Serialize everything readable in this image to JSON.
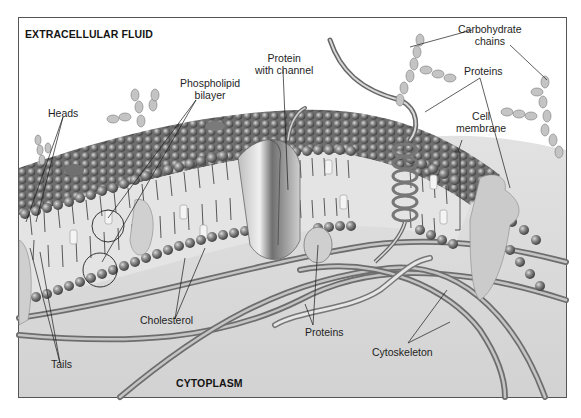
{
  "diagram": {
    "regions": {
      "top": "EXTRACELLULAR FLUID",
      "bottom": "CYTOPLASM"
    },
    "labels": {
      "heads": "Heads",
      "phospholipid_line1": "Phospholipid",
      "phospholipid_line2": "bilayer",
      "protein_channel_line1": "Protein",
      "protein_channel_line2": "with channel",
      "carbohydrate_line1": "Carbohydrate",
      "carbohydrate_line2": "chains",
      "proteins_top": "Proteins",
      "cell_membrane_line1": "Cell",
      "cell_membrane_line2": "membrane",
      "tails": "Tails",
      "cholesterol": "Cholesterol",
      "proteins_bottom": "Proteins",
      "cytoskeleton": "Cytoskeleton"
    },
    "colors": {
      "frame": "#555555",
      "background_top": "#ffffff",
      "cytoplasm": "#d6d6d6",
      "head_sphere": "#7a7a7a",
      "membrane_core": "#e2e2e2",
      "leader_line": "#1a1a1a"
    }
  }
}
